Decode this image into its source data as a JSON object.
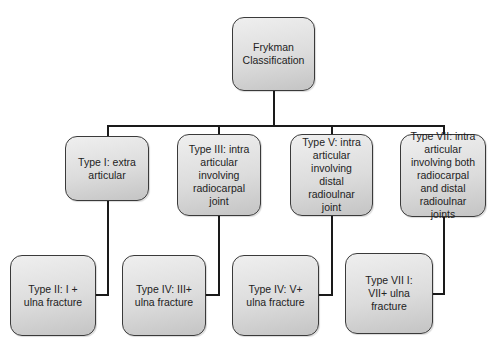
{
  "diagram": {
    "type": "tree",
    "root": {
      "label": "Frykman\nClassification"
    },
    "level2": [
      {
        "label": "Type I: extra\narticular"
      },
      {
        "label": "Type III: intra\narticular\ninvolving\nradiocarpal\njoint"
      },
      {
        "label": "Type V: intra\narticular\ninvolving\ndistal\nradioulnar\njoint"
      },
      {
        "label": "Type VII: intra\narticular\ninvolving both\nradiocarpal\nand distal\nradioulnar\njoints"
      }
    ],
    "level3": [
      {
        "label": "Type II: I +\nulna fracture"
      },
      {
        "label": "Type IV: III+\nulna fracture"
      },
      {
        "label": "Type IV: V+\nulna fracture"
      },
      {
        "label": "Type VII I:\nVII+ ulna\nfracture"
      }
    ],
    "colors": {
      "box_fill_top": "#efefef",
      "box_fill_bottom": "#c4c4c4",
      "box_border": "#3a3a3a",
      "connector": "#1a1a1a",
      "background": "#ffffff"
    }
  }
}
